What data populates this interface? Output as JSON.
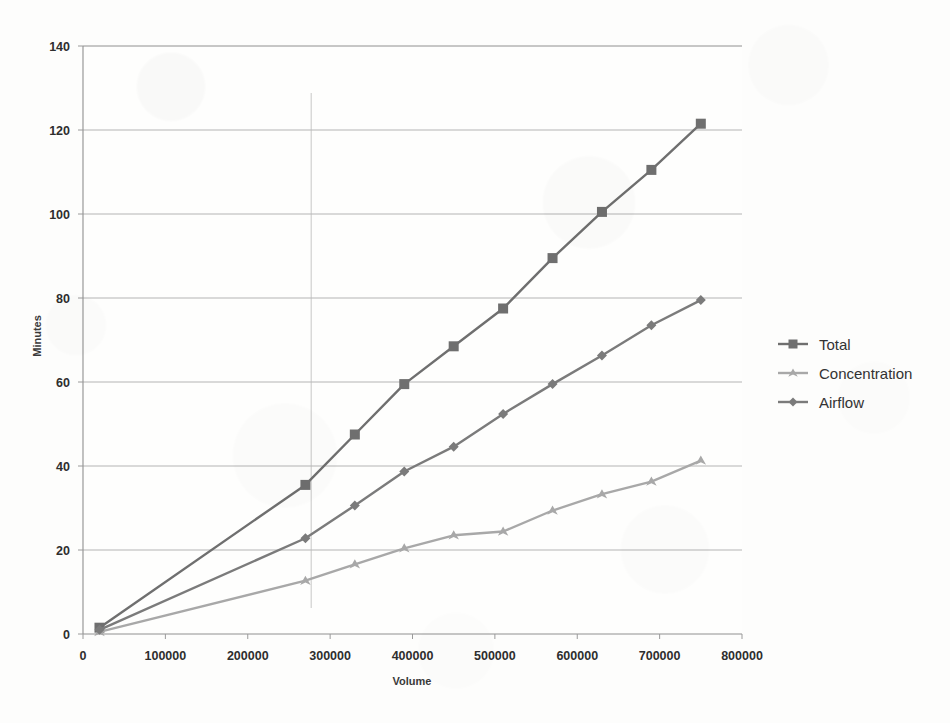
{
  "chart_data": {
    "type": "line",
    "title": "",
    "xlabel": "Volume",
    "ylabel": "Minutes",
    "xlim": [
      0,
      800000
    ],
    "ylim": [
      0,
      140
    ],
    "xticks": [
      0,
      100000,
      200000,
      300000,
      400000,
      500000,
      600000,
      700000,
      800000
    ],
    "xtick_labels": [
      "0",
      "100000",
      "200000",
      "300000",
      "400000",
      "500000",
      "600000",
      "700000",
      "800000"
    ],
    "yticks": [
      0,
      20,
      40,
      60,
      80,
      100,
      120,
      140
    ],
    "ytick_labels": [
      "0",
      "20",
      "40",
      "60",
      "80",
      "100",
      "120",
      "140"
    ],
    "grid": "horizontal",
    "legend_position": "right",
    "x": [
      20000,
      270000,
      330000,
      390000,
      450000,
      510000,
      570000,
      630000,
      690000,
      750000
    ],
    "series": [
      {
        "name": "Total",
        "marker": "square",
        "color": "#6f6f6f",
        "values": [
          1.5,
          35.5,
          47.5,
          59.5,
          68.5,
          77.5,
          89.5,
          100.5,
          110.5,
          121.5
        ]
      },
      {
        "name": "Concentration",
        "marker": "triangle",
        "color": "#a8a8a8",
        "values": [
          0.5,
          12.7,
          16.6,
          20.4,
          23.5,
          24.4,
          29.4,
          33.3,
          36.3,
          41.3
        ]
      },
      {
        "name": "Airflow",
        "marker": "diamond",
        "color": "#7b7b7b",
        "values": [
          1.0,
          22.8,
          30.6,
          38.7,
          44.6,
          52.4,
          59.5,
          66.3,
          73.5,
          79.5
        ]
      }
    ],
    "annotations": [
      {
        "type": "vertical-reference-line",
        "x": 277000,
        "color": "#b9b9b9"
      }
    ]
  },
  "legend": {
    "items": [
      {
        "label": "Total"
      },
      {
        "label": "Concentration"
      },
      {
        "label": "Airflow"
      }
    ]
  },
  "axes": {
    "x_title": "Volume",
    "y_title": "Minutes"
  },
  "colors": {
    "plot_background": "#fdfdfc",
    "gridline": "#b4b4b4",
    "axis_line": "#9a9a9a",
    "tick_text": "#2e2e2e"
  }
}
